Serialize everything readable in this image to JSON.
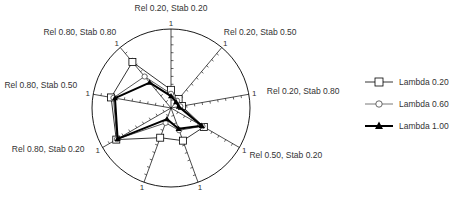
{
  "chart_data": {
    "type": "radar",
    "title": "",
    "axis_max": 1,
    "axis_max_label": "1",
    "ticks_per_axis": 10,
    "grid": false,
    "legend_position": "right",
    "categories": [
      "Rel 0.20, Stab 0.20",
      "Rel 0.20, Stab 0.50",
      "Rel 0.20, Stab 0.80",
      "Rel 0.50, Stab 0.20",
      "",
      "",
      "Rel 0.80, Stab 0.20",
      "Rel 0.80, Stab 0.50",
      "Rel 0.80, Stab 0.80"
    ],
    "series": [
      {
        "name": "Lambda 0.20",
        "marker": "open-square",
        "values": [
          0.23,
          0.15,
          0.14,
          0.48,
          0.44,
          0.4,
          0.8,
          0.77,
          0.76
        ]
      },
      {
        "name": "Lambda 0.60",
        "marker": "open-circle",
        "values": [
          0.18,
          0.12,
          0.12,
          0.46,
          0.3,
          0.2,
          0.79,
          0.74,
          0.52
        ]
      },
      {
        "name": "Lambda 1.00",
        "marker": "filled-triangle",
        "values": [
          0.15,
          0.1,
          0.1,
          0.45,
          0.28,
          0.15,
          0.78,
          0.72,
          0.42
        ]
      }
    ]
  },
  "legend": {
    "items": [
      {
        "label": "Lambda 0.20"
      },
      {
        "label": "Lambda 0.60"
      },
      {
        "label": "Lambda 1.00"
      }
    ]
  }
}
